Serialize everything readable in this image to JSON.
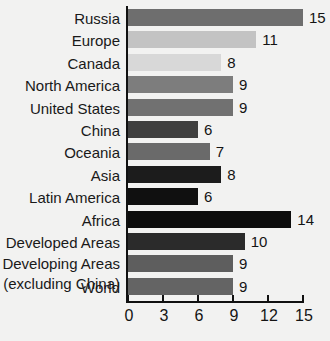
{
  "chart_data": {
    "type": "bar",
    "orientation": "horizontal",
    "title": "",
    "subtitle": "",
    "xlabel": "",
    "ylabel": "",
    "xlim": [
      0,
      15
    ],
    "ylim": null,
    "grid": false,
    "legend": null,
    "xticks": [
      0,
      3,
      6,
      9,
      12,
      15
    ],
    "xtick_labels": [
      "0",
      "3",
      "6",
      "9",
      "12",
      "15"
    ],
    "categories": [
      "Russia",
      "Europe",
      "Canada",
      "North America",
      "United States",
      "China",
      "Oceania",
      "Asia",
      "Latin America",
      "Africa",
      "Developed Areas",
      "Developing Areas (excluding China)",
      "World"
    ],
    "values": [
      15,
      11,
      8,
      9,
      9,
      6,
      7,
      8,
      6,
      14,
      10,
      9,
      9
    ],
    "value_labels": [
      "15",
      "11",
      "8",
      "9",
      "9",
      "6",
      "7",
      "8",
      "6",
      "14",
      "10",
      "9",
      "9"
    ],
    "bar_colors": [
      "#6e6e6e",
      "#c3c3c3",
      "#d8d8d8",
      "#7d7d7d",
      "#717171",
      "#3f3f3f",
      "#6a6a6a",
      "#1c1c1c",
      "#101010",
      "#0d0d0d",
      "#2b2b2b",
      "#5e5e5e",
      "#646464"
    ]
  },
  "rows": [
    {
      "label_line1": "Russia",
      "label_line2": ""
    },
    {
      "label_line1": "Europe",
      "label_line2": ""
    },
    {
      "label_line1": "Canada",
      "label_line2": ""
    },
    {
      "label_line1": "North America",
      "label_line2": ""
    },
    {
      "label_line1": "United States",
      "label_line2": ""
    },
    {
      "label_line1": "China",
      "label_line2": ""
    },
    {
      "label_line1": "Oceania",
      "label_line2": ""
    },
    {
      "label_line1": "Asia",
      "label_line2": ""
    },
    {
      "label_line1": "Latin America",
      "label_line2": ""
    },
    {
      "label_line1": "Africa",
      "label_line2": ""
    },
    {
      "label_line1": "Developed Areas",
      "label_line2": ""
    },
    {
      "label_line1": "Developing Areas",
      "label_line2": "(excluding China)"
    },
    {
      "label_line1": "World",
      "label_line2": ""
    }
  ],
  "colors": {
    "background": "#f2f2f1",
    "axis": "#111111",
    "text": "#141414"
  }
}
